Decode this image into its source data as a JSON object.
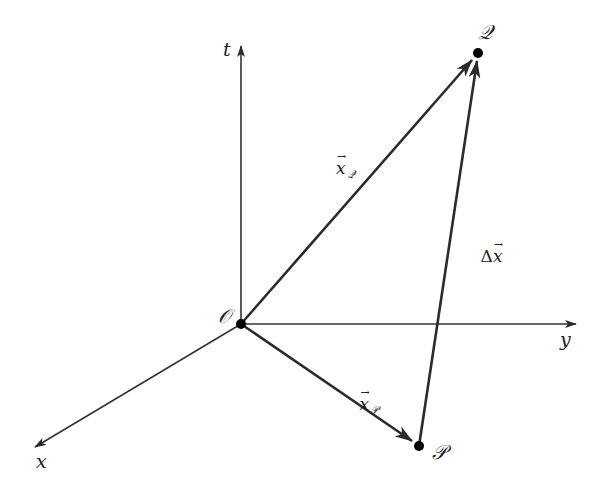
{
  "diagram": {
    "title": "",
    "colors": {
      "background": "#ffffff",
      "axis": "#333333",
      "vector": "#2b2b2b",
      "point": "#000000",
      "text": "#222222"
    },
    "axes": {
      "t": {
        "label": "t",
        "from": [
          241,
          324
        ],
        "to": [
          241,
          45
        ]
      },
      "y": {
        "label": "y",
        "from": [
          241,
          324
        ],
        "to": [
          576,
          324
        ]
      },
      "x": {
        "label": "x",
        "from": [
          241,
          324
        ],
        "to": [
          34,
          448
        ]
      }
    },
    "points": {
      "origin": {
        "label": "𝒪",
        "plain": "O",
        "xy": [
          241,
          324
        ]
      },
      "Q": {
        "label": "𝒬",
        "plain": "Q",
        "xy": [
          478,
          53
        ]
      },
      "P": {
        "label": "𝒫",
        "plain": "P",
        "xy": [
          419,
          446
        ]
      }
    },
    "vectors": {
      "xQ": {
        "base": "x",
        "subscript": "𝒬",
        "arrow": "→",
        "from": "origin",
        "to": "Q"
      },
      "xP": {
        "base": "x",
        "subscript": "𝒫",
        "arrow": "→",
        "from": "origin",
        "to": "P"
      },
      "dx": {
        "prefix": "Δ",
        "base": "x",
        "arrow": "→",
        "from": "P",
        "to": "Q"
      }
    }
  }
}
